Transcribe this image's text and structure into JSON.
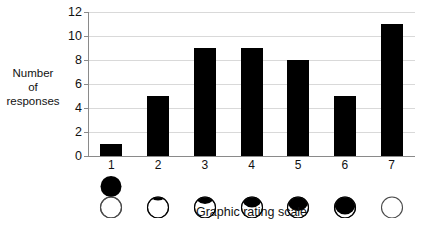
{
  "chart_data": {
    "type": "bar",
    "title": "",
    "xlabel": "Graphic rating scale",
    "ylabel": "Number of responses",
    "ylabel_lines": [
      "Number",
      "of",
      "responses"
    ],
    "categories": [
      "1",
      "2",
      "3",
      "4",
      "5",
      "6",
      "7"
    ],
    "values": [
      1,
      5,
      9,
      9,
      8,
      5,
      11
    ],
    "ylim": [
      0,
      12
    ],
    "ytick_labels": [
      "0",
      "2",
      "4",
      "6",
      "8",
      "10",
      "12"
    ],
    "ytick_values": [
      0,
      2,
      4,
      6,
      8,
      10,
      12
    ],
    "grid": true,
    "legend": null,
    "bar_color": "#000000",
    "gridline_color": "#d9d9d9",
    "axis_color": "#8a8a8a",
    "background_color": "#ffffff",
    "scale_icons": [
      {
        "category": "1",
        "black_circle_offset": 0,
        "description": "filled black circle fully separated above empty circle"
      },
      {
        "category": "2",
        "black_circle_offset": 1,
        "description": "black circle slightly overlapping top of empty circle"
      },
      {
        "category": "3",
        "black_circle_offset": 2,
        "description": "black circle overlapping upper half of empty circle"
      },
      {
        "category": "4",
        "black_circle_offset": 3,
        "description": "black circle covering top third of empty circle"
      },
      {
        "category": "5",
        "black_circle_offset": 4,
        "description": "black cap on top of empty circle"
      },
      {
        "category": "6",
        "black_circle_offset": 5,
        "description": "thin black sliver on top of empty circle"
      },
      {
        "category": "7",
        "black_circle_offset": 6,
        "description": "empty circle only, black circle fully merged"
      }
    ]
  }
}
